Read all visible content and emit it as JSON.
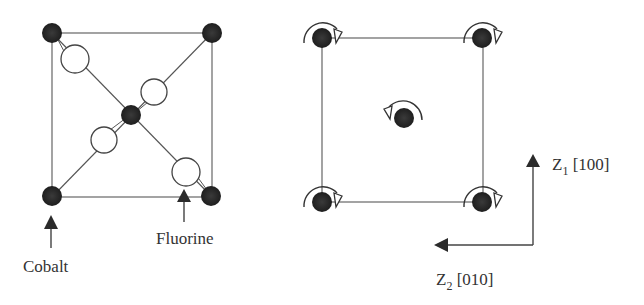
{
  "left_diagram": {
    "title": "CoF2 unit cell projection",
    "labels": {
      "cobalt": "Cobalt",
      "fluorine": "Fluorine"
    },
    "colors": {
      "cobalt_atom": "#2b2b2b",
      "fluorine_atom": "#ffffff",
      "line": "#555555"
    }
  },
  "right_diagram": {
    "axes": {
      "z1_base": "Z",
      "z1_sub": "1",
      "z1_dir": " [100]",
      "z2_base": "Z",
      "z2_sub": "2",
      "z2_dir": " [010]"
    },
    "rotation_senses": {
      "corners": "clockwise",
      "center": "counterclockwise"
    }
  }
}
